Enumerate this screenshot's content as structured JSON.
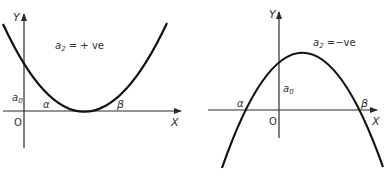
{
  "diagrams": [
    {
      "name": "upward-parabola",
      "y_axis_label": "Y",
      "x_axis_label": "X",
      "origin_label": "O",
      "intercept_label": "a",
      "intercept_sub": "0",
      "root_alpha": "α",
      "root_beta": "β",
      "coef_label": "a",
      "coef_sub": "2",
      "condition": " = + ve"
    },
    {
      "name": "downward-parabola",
      "y_axis_label": "Y",
      "x_axis_label": "X",
      "origin_label": "O",
      "intercept_label": "a",
      "intercept_sub": "0",
      "root_alpha": "α",
      "root_beta": "β",
      "coef_label": "a",
      "coef_sub": "2",
      "condition": " =−ve"
    }
  ],
  "colors": {
    "curve": "#111111",
    "axis": "#2a2a2a",
    "text": "#333333",
    "background": "#ffffff"
  }
}
